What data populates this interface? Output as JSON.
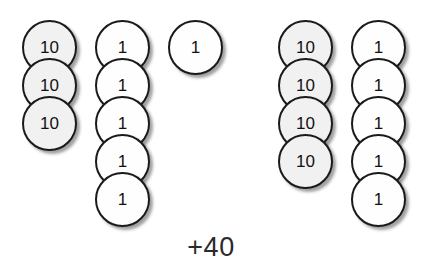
{
  "diagram": {
    "caption": "+40",
    "coin_diameter": 55,
    "stack_pitch": 38,
    "colors": {
      "ten_fill": "#f1f1f1",
      "one_fill": "#fefefe",
      "outline": "#1a1a1a",
      "text": "#111111",
      "background": "#ffffff"
    },
    "groups": [
      {
        "name": "left-group",
        "stacks": [
          {
            "name": "tens-stack-left",
            "denomination": "10",
            "count": 3,
            "x": 22,
            "y": 20,
            "coins": [
              {
                "label": "10"
              },
              {
                "label": "10"
              },
              {
                "label": "10"
              }
            ]
          },
          {
            "name": "ones-stack-left",
            "denomination": "1",
            "count": 5,
            "x": 95,
            "y": 20,
            "coins": [
              {
                "label": "1"
              },
              {
                "label": "1"
              },
              {
                "label": "1"
              },
              {
                "label": "1"
              },
              {
                "label": "1"
              }
            ]
          },
          {
            "name": "single-one-coin",
            "denomination": "1",
            "count": 1,
            "x": 168,
            "y": 20,
            "coins": [
              {
                "label": "1"
              }
            ]
          }
        ]
      },
      {
        "name": "right-group",
        "stacks": [
          {
            "name": "tens-stack-right",
            "denomination": "10",
            "count": 4,
            "x": 278,
            "y": 20,
            "coins": [
              {
                "label": "10"
              },
              {
                "label": "10"
              },
              {
                "label": "10"
              },
              {
                "label": "10"
              }
            ]
          },
          {
            "name": "ones-stack-right",
            "denomination": "1",
            "count": 5,
            "x": 351,
            "y": 20,
            "coins": [
              {
                "label": "1"
              },
              {
                "label": "1"
              },
              {
                "label": "1"
              },
              {
                "label": "1"
              },
              {
                "label": "1"
              }
            ]
          }
        ]
      }
    ]
  }
}
